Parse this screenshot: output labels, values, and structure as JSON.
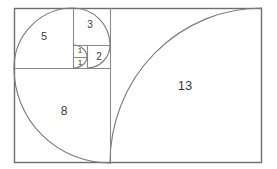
{
  "figure": {
    "type": "diagram",
    "sequence": [
      1,
      1,
      2,
      3,
      5,
      8,
      13
    ],
    "stroke_color": "#6e6e6e",
    "inner_stroke_color": "#8a8a8a",
    "spiral_color": "#7a7a7a",
    "label_color": "#3a3a3a",
    "background": "#ffffff",
    "canvas": {
      "width": 277,
      "height": 169
    },
    "bounds": {
      "x": 14,
      "y": 8,
      "width": 248,
      "height": 155
    }
  },
  "squares": [
    {
      "id": "sq-13",
      "label": "13",
      "value": 13,
      "x": 110,
      "y": 8,
      "size_w": 152,
      "size_h": 155,
      "label_x": 185,
      "label_y": 87,
      "font_size": 13,
      "arc": "M 110,163 A 152,155 0 0 1 262,8"
    },
    {
      "id": "sq-8",
      "label": "8",
      "value": 8,
      "x": 14,
      "y": 68,
      "size_w": 96,
      "size_h": 95,
      "label_x": 64,
      "label_y": 112,
      "font_size": 12,
      "arc": "M 14,68 A 96,95 0 0 0 110,163"
    },
    {
      "id": "sq-5",
      "label": "5",
      "value": 5,
      "x": 14,
      "y": 8,
      "size_w": 59,
      "size_h": 60,
      "label_x": 44,
      "label_y": 37,
      "font_size": 11,
      "arc": "M 73,8 A 59,60 0 0 0 14,68"
    },
    {
      "id": "sq-3",
      "label": "3",
      "value": 3,
      "x": 73,
      "y": 8,
      "size_w": 37,
      "size_h": 37,
      "label_x": 90,
      "label_y": 25,
      "font_size": 10,
      "arc": "M 110,45 A 37,37 0 0 0 73,8"
    },
    {
      "id": "sq-2",
      "label": "2",
      "value": 2,
      "x": 87,
      "y": 45,
      "size_w": 23,
      "size_h": 23,
      "label_x": 99,
      "label_y": 57,
      "font_size": 10,
      "arc": "M 87,68 A 23,23 0 0 0 110,45"
    },
    {
      "id": "sq-1-upper",
      "label": "1",
      "value": 1,
      "x": 73,
      "y": 45,
      "size_w": 14,
      "size_h": 12,
      "label_x": 80,
      "label_y": 51,
      "font_size": 8,
      "arc": "M 73,45 A 14,12 0 0 1 87,57"
    },
    {
      "id": "sq-1-lower",
      "label": "1",
      "value": 1,
      "x": 73,
      "y": 57,
      "size_w": 14,
      "size_h": 11,
      "label_x": 80,
      "label_y": 63,
      "font_size": 8,
      "arc": "M 87,57 A 14,11 0 0 1 73,68"
    }
  ],
  "dividers": [
    {
      "id": "div-vertical-13",
      "x1": 110,
      "y1": 8,
      "x2": 110,
      "y2": 163
    },
    {
      "id": "div-horizontal-8",
      "x1": 14,
      "y1": 68,
      "x2": 110,
      "y2": 68
    },
    {
      "id": "div-vertical-5",
      "x1": 73,
      "y1": 8,
      "x2": 73,
      "y2": 68
    },
    {
      "id": "div-horizontal-3",
      "x1": 73,
      "y1": 45,
      "x2": 110,
      "y2": 45
    },
    {
      "id": "div-vertical-2",
      "x1": 87,
      "y1": 45,
      "x2": 87,
      "y2": 68
    },
    {
      "id": "div-horizontal-1",
      "x1": 73,
      "y1": 57,
      "x2": 87,
      "y2": 57
    }
  ]
}
